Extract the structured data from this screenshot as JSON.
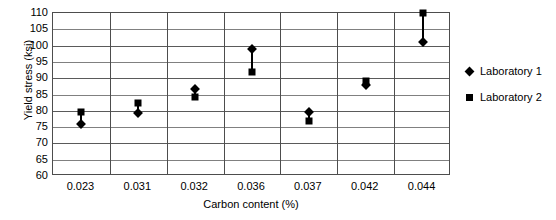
{
  "chart_data": {
    "type": "scatter",
    "title": "",
    "xlabel": "Carbon content (%)",
    "ylabel": "Yield stress (ksi)",
    "categories": [
      "0.023",
      "0.031",
      "0.032",
      "0.036",
      "0.037",
      "0.042",
      "0.044"
    ],
    "ylim": [
      60,
      110
    ],
    "ytick_labels": [
      "110",
      "105",
      "100",
      "95",
      "90",
      "85",
      "80",
      "75",
      "70",
      "65",
      "60"
    ],
    "yticks": [
      110,
      105,
      100,
      95,
      90,
      85,
      80,
      75,
      70,
      65,
      60
    ],
    "grid": true,
    "legend_position": "right",
    "series": [
      {
        "name": "Laboratory 1",
        "marker": "diamond",
        "color": "#000000",
        "values": [
          76.0,
          79.3,
          86.8,
          99.0,
          79.6,
          87.8,
          101.2
        ]
      },
      {
        "name": "Laboratory 2",
        "marker": "square",
        "color": "#000000",
        "values": [
          79.6,
          82.5,
          84.2,
          92.0,
          77.0,
          89.0,
          110.0
        ]
      }
    ],
    "connectors": true
  },
  "legend": {
    "items": [
      {
        "label": "Laboratory 1",
        "marker": "diamond"
      },
      {
        "label": "Laboratory 2",
        "marker": "square"
      }
    ]
  }
}
